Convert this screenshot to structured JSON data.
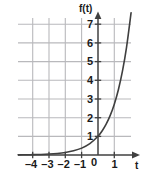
{
  "chart_data": {
    "type": "line",
    "title": "",
    "xlabel": "t",
    "ylabel": "f(t)",
    "function": "f(t) = e^t",
    "xlim": [
      -4.9,
      1.9
    ],
    "ylim": [
      -0.35,
      7.6
    ],
    "grid": true,
    "legend": false,
    "xticks": [
      -4,
      -3,
      -2,
      -1,
      0,
      1
    ],
    "xtick_labels": [
      "–4",
      "–3",
      "–2",
      "–1",
      "0",
      "1"
    ],
    "yticks": [
      1,
      2,
      3,
      4,
      5,
      6,
      7
    ],
    "ytick_labels": [
      "1",
      "2",
      "3",
      "4",
      "5",
      "6",
      "7"
    ],
    "x": [
      -4.9,
      -4.5,
      -4,
      -3.5,
      -3,
      -2.5,
      -2,
      -1.5,
      -1,
      -0.5,
      0,
      0.25,
      0.5,
      0.75,
      1,
      1.25,
      1.5,
      1.75,
      2.03
    ],
    "values": [
      0.0074,
      0.0111,
      0.0183,
      0.0302,
      0.0498,
      0.0821,
      0.1353,
      0.2231,
      0.3679,
      0.6065,
      1.0,
      1.284,
      1.6487,
      2.117,
      2.7183,
      3.49,
      4.4817,
      5.755,
      7.61
    ],
    "y_axis_intercept": 2.718,
    "curve_color": "#3f3f3f",
    "grid_color": "#b9b9bc",
    "axis_color": "#404040"
  },
  "axis_labels": {
    "y": "f(t)",
    "x": "t"
  }
}
